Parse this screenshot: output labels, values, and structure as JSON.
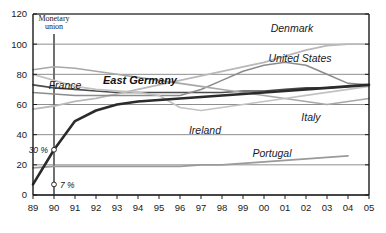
{
  "chart_data": {
    "type": "line",
    "title": "",
    "xlabel": "",
    "ylabel": "",
    "xlim": [
      1989,
      2005
    ],
    "ylim": [
      0,
      120
    ],
    "yticks": [
      0,
      20,
      40,
      60,
      80,
      100,
      120
    ],
    "xticks": [
      "89",
      "90",
      "91",
      "92",
      "93",
      "94",
      "95",
      "96",
      "97",
      "98",
      "99",
      "00",
      "01",
      "02",
      "03",
      "04",
      "05"
    ],
    "x": [
      1989,
      1990,
      1991,
      1992,
      1993,
      1994,
      1995,
      1996,
      1997,
      1998,
      1999,
      2000,
      2001,
      2002,
      2003,
      2004,
      2005
    ],
    "grid": "horizontal",
    "legend": "inline-labels",
    "series": [
      {
        "name": "East Germany",
        "color": "#2b2b2b",
        "width": 2.6,
        "emphasis": true,
        "values": [
          7,
          30,
          49,
          56,
          60,
          62,
          63,
          64,
          65,
          66,
          67,
          68,
          69,
          70,
          71,
          72,
          73
        ]
      },
      {
        "name": "France",
        "color": "#4d4d4d",
        "width": 1.6,
        "emphasis": false,
        "values": [
          73,
          71,
          70,
          69,
          68,
          68,
          68,
          68,
          68,
          68,
          69,
          69,
          70,
          71,
          71,
          72,
          73
        ]
      },
      {
        "name": "Denmark",
        "color": "#b9b9b9",
        "width": 1.8,
        "emphasis": false,
        "values": [
          57,
          59,
          62,
          64,
          67,
          70,
          73,
          76,
          79,
          82,
          85,
          88,
          92,
          96,
          99,
          100,
          100
        ]
      },
      {
        "name": "United States",
        "color": "#8c8c8c",
        "width": 1.6,
        "emphasis": false,
        "values": [
          68,
          67,
          66,
          66,
          66,
          66,
          66,
          66,
          70,
          76,
          82,
          86,
          88,
          86,
          80,
          74,
          73
        ]
      },
      {
        "name": "Italy",
        "color": "#a8a8a8",
        "width": 1.6,
        "emphasis": false,
        "values": [
          83,
          85,
          84,
          82,
          80,
          78,
          76,
          74,
          72,
          70,
          68,
          66,
          64,
          62,
          60,
          62,
          64
        ]
      },
      {
        "name": "Ireland",
        "color": "#c2c2c2",
        "width": 1.7,
        "emphasis": false,
        "values": [
          80,
          76,
          72,
          70,
          69,
          68,
          66,
          58,
          56,
          58,
          60,
          62,
          64,
          66,
          68,
          70,
          72
        ]
      },
      {
        "name": "Portugal",
        "color": "#9a9a9a",
        "width": 1.7,
        "emphasis": false,
        "values": [
          18,
          19,
          19,
          19,
          19,
          19,
          19,
          19,
          20,
          20,
          21,
          22,
          23,
          24,
          25,
          26,
          null
        ]
      }
    ],
    "annotations": [
      {
        "id": "monetary-union",
        "text": "Monetary\nunion",
        "line1": "Monetary",
        "line2": "union",
        "x": 1990,
        "vline": true
      },
      {
        "id": "start-value-eastgermany",
        "text": "30 %",
        "x": 1990,
        "y": 30
      },
      {
        "id": "base-value-eastgermany",
        "text": "7 %",
        "x": 1990,
        "y": 7
      }
    ],
    "series_label_positions": [
      {
        "name": "France",
        "x": 65,
        "y": 89,
        "bold": false
      },
      {
        "name": "East Germany",
        "x": 140,
        "y": 84,
        "bold": true
      },
      {
        "name": "Denmark",
        "x": 292,
        "y": 32,
        "bold": false
      },
      {
        "name": "United States",
        "x": 300,
        "y": 62,
        "bold": false
      },
      {
        "name": "Italy",
        "x": 311,
        "y": 121,
        "bold": false
      },
      {
        "name": "Ireland",
        "x": 205,
        "y": 134,
        "bold": false
      },
      {
        "name": "Portugal",
        "x": 272,
        "y": 157,
        "bold": false
      }
    ],
    "colors": {
      "frame": "#1a1a1a",
      "gridline": "#8f8f8f",
      "background": "#ffffff",
      "vline": "#707070",
      "emphasis_series": "#2b2b2b"
    }
  }
}
